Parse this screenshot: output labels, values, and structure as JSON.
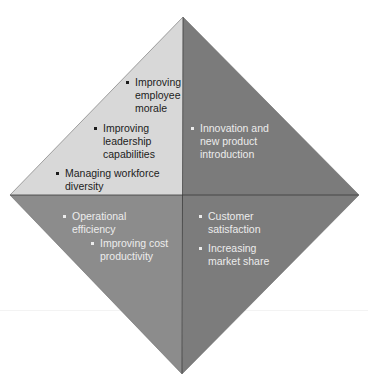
{
  "diagram": {
    "type": "diamond-quadrant",
    "colors": {
      "top_left": "#d8d8d8",
      "top_right": "#7b7b7b",
      "bottom_left": "#8c8c8c",
      "bottom_right": "#7c7c7c",
      "divider": "#3a3a3a"
    },
    "quadrants": {
      "top_left": {
        "items": [
          {
            "label": "Improving employee morale"
          },
          {
            "label": "Improving leadership capabilities"
          },
          {
            "label": "Managing workforce diversity"
          }
        ]
      },
      "top_right": {
        "items": [
          {
            "label": "Innovation and new product introduction"
          }
        ]
      },
      "bottom_left": {
        "items": [
          {
            "label": "Operational efficiency"
          },
          {
            "label": "Improving cost productivity"
          }
        ]
      },
      "bottom_right": {
        "items": [
          {
            "label": "Customer satisfaction"
          },
          {
            "label": "Increasing market share"
          }
        ]
      }
    }
  }
}
